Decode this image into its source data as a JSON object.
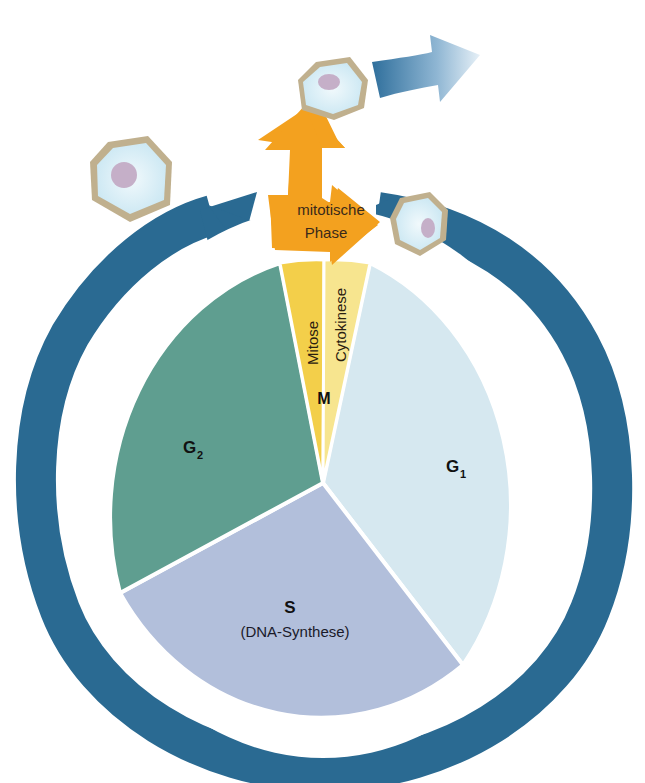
{
  "diagram": {
    "type": "cell-cycle",
    "colors": {
      "ring": "#2a6a92",
      "g1": "#d6e8f0",
      "s": "#b2bfdb",
      "g2": "#5f9e90",
      "mitosis": "#f3cf4a",
      "cytokinesis": "#f7e58f",
      "mitotic_arrow": "#f3a11f",
      "cell_membrane": "#c0b08e",
      "cell_cytoplasm": "#e4f3f9",
      "cell_nucleus": "#c5afc8",
      "exit_arrow": "#3a7aa6"
    },
    "phases": {
      "g1": {
        "label": "G",
        "sub": "1"
      },
      "g2": {
        "label": "G",
        "sub": "2"
      },
      "s": {
        "label": "S",
        "detail": "(DNA-Synthese)"
      },
      "m": {
        "label": "M"
      },
      "mitosis": {
        "label": "Mitose"
      },
      "cytokinesis": {
        "label": "Cytokinese"
      }
    },
    "ring_label": "Interphase",
    "mitotic_phase": {
      "line1": "mitotische",
      "line2": "Phase"
    }
  }
}
